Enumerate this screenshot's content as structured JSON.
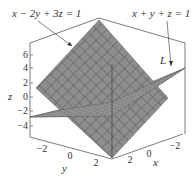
{
  "figure": {
    "plane1_label": "x − 2y + 3z = 1",
    "plane2_label": "x + y + z = 1",
    "line_label": "L",
    "z_axis": {
      "label": "z",
      "ticks": [
        "6",
        "4",
        "2",
        "0",
        "−2",
        "−4"
      ]
    },
    "y_axis": {
      "label": "y",
      "ticks": [
        "−2",
        "0",
        "2"
      ]
    },
    "x_axis": {
      "label": "x",
      "ticks": [
        "2",
        "0",
        "−2"
      ]
    },
    "colors": {
      "plane1": "#8a8a8a",
      "plane2": "#a8a8a8",
      "grid": "#555555",
      "box": "#444444"
    }
  }
}
